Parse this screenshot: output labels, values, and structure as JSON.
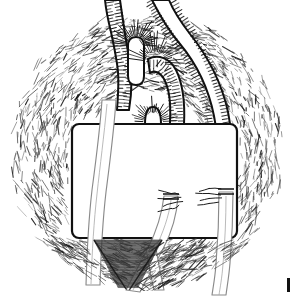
{
  "figure": {
    "medium": "pen-and-ink hatched drawing",
    "caption": "",
    "canvas": {
      "width": 291,
      "height": 300,
      "background_color": "#ffffff"
    },
    "ink_color": "#111111",
    "hatch_color": "#3a3a3a",
    "graft_color": "#8a8a8a"
  },
  "composition": {
    "vignette": {
      "name": "circular hatched tissue field",
      "shape": "circle",
      "center_x": 146,
      "center_y": 150,
      "radius": 140,
      "description": "radial pen hatching forming a round operative field"
    },
    "drape": {
      "name": "white rectangular surgical drape window",
      "x": 72,
      "y": 124,
      "width": 165,
      "height": 114,
      "corner_radius": 7,
      "fill": "#ffffff",
      "stroke": "#111111"
    }
  },
  "structures": [
    {
      "id": "vessel-left-stump",
      "label": "left cut vessel stump",
      "kind": "vessel",
      "hatched": true
    },
    {
      "id": "vessel-left-descending",
      "label": "left descending vessel",
      "kind": "graft",
      "hatched": false
    },
    {
      "id": "vessel-middle-arch",
      "label": "middle arched vessel",
      "kind": "vessel",
      "hatched": true
    },
    {
      "id": "vessel-right-arch",
      "label": "right arched vessel",
      "kind": "vessel",
      "hatched": true
    },
    {
      "id": "vessel-small-loop",
      "label": "small vessel loop stump",
      "kind": "vessel",
      "hatched": true
    },
    {
      "id": "graft-left",
      "label": "left graft limb",
      "kind": "graft",
      "hatched": false
    },
    {
      "id": "graft-middle",
      "label": "middle graft limb",
      "kind": "graft",
      "hatched": false
    },
    {
      "id": "graft-right",
      "label": "right graft limb",
      "kind": "graft",
      "hatched": false
    }
  ],
  "anastomoses": [
    {
      "id": "anastomosis-middle",
      "label": "middle end-to-end anastomosis",
      "x": 178,
      "y": 196,
      "sutures": 4
    },
    {
      "id": "anastomosis-right",
      "label": "right end-to-end anastomosis",
      "x": 216,
      "y": 191,
      "sutures": 4
    }
  ],
  "markings": {
    "corner_mark": {
      "label": "partial edge mark",
      "x": 287,
      "y": 278,
      "width": 3,
      "height": 14
    }
  }
}
